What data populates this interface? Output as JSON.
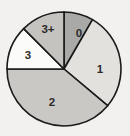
{
  "chart_data": {
    "type": "pie",
    "title": "",
    "subtitle": "",
    "xlabel": "",
    "ylabel": "",
    "grid": false,
    "legend_position": "none",
    "labels_inside_slices": true,
    "background_color": "#f2f1ef",
    "outline_color": "#1a1a1a",
    "label_color": "#2b2b2b",
    "center": {
      "cx": 64,
      "cy": 69,
      "r": 57
    },
    "start_angle_deg": 0,
    "direction": "clockwise",
    "categories": [
      "0",
      "1",
      "2",
      "3",
      "3+"
    ],
    "values": [
      8.3,
      27.8,
      38.9,
      12.5,
      12.5
    ],
    "units": "percent",
    "slices": [
      {
        "label": "0",
        "value": 8.3,
        "start_angle_deg": 0,
        "end_angle_deg": 30,
        "color": "#a9a9a7",
        "label_x": 79,
        "label_y": 34
      },
      {
        "label": "1",
        "value": 27.8,
        "start_angle_deg": 30,
        "end_angle_deg": 130,
        "color": "#e2e1dd",
        "label_x": 100,
        "label_y": 70
      },
      {
        "label": "2",
        "value": 38.9,
        "start_angle_deg": 130,
        "end_angle_deg": 270,
        "color": "#c9c8c4",
        "label_x": 52,
        "label_y": 103
      },
      {
        "label": "3",
        "value": 12.5,
        "start_angle_deg": 270,
        "end_angle_deg": 315,
        "color": "#fbfbf9",
        "label_x": 28,
        "label_y": 56
      },
      {
        "label": "3+",
        "value": 12.5,
        "start_angle_deg": 315,
        "end_angle_deg": 360,
        "color": "#c4c3bf",
        "label_x": 48,
        "label_y": 30
      }
    ]
  }
}
